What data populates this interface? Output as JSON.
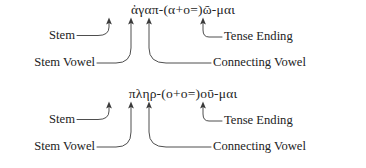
{
  "figure": {
    "type": "linguistic-morphology-annotation",
    "text_color": "#232323",
    "line_color": "#3a3a3a",
    "background": "#ffffff"
  },
  "blocks": [
    {
      "id": "block-1",
      "word": "ἀγαπ-(α+ο=)ῶ-μαι",
      "labels": {
        "stem": "Stem",
        "stem_vowel": "Stem Vowel",
        "connecting_vowel": "Connecting Vowel",
        "tense_ending": "Tense Ending"
      }
    },
    {
      "id": "block-2",
      "word": "πληρ-(ο+ο=)οῦ-μαι",
      "labels": {
        "stem": "Stem",
        "stem_vowel": "Stem Vowel",
        "connecting_vowel": "Connecting Vowel",
        "tense_ending": "Tense Ending"
      }
    }
  ]
}
